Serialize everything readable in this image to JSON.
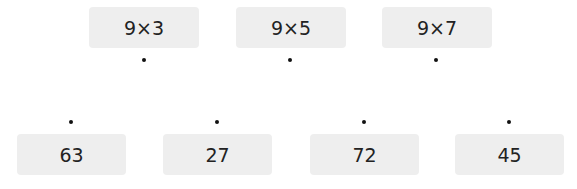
{
  "expressions": [
    {
      "label": "9×3"
    },
    {
      "label": "9×5"
    },
    {
      "label": "9×7"
    }
  ],
  "answers": [
    {
      "label": "63"
    },
    {
      "label": "27"
    },
    {
      "label": "72"
    },
    {
      "label": "45"
    }
  ],
  "colors": {
    "box_bg": "#eeeeee",
    "text": "#222222",
    "dot": "#111111"
  }
}
